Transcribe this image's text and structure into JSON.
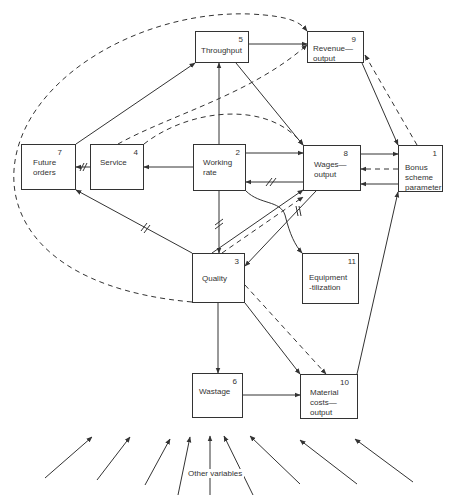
{
  "diagram": {
    "nodes": [
      {
        "id": "1",
        "label": "Bonus\nscheme\nparameter",
        "x": 398,
        "y": 145,
        "w": 45,
        "h": 47,
        "ly": 17
      },
      {
        "id": "2",
        "label": "Working\nrate",
        "x": 193,
        "y": 144,
        "w": 53,
        "h": 47,
        "ly": 13
      },
      {
        "id": "3",
        "label": "Quality",
        "x": 192,
        "y": 253,
        "w": 53,
        "h": 50,
        "ly": 20
      },
      {
        "id": "4",
        "label": "Service",
        "x": 90,
        "y": 144,
        "w": 54,
        "h": 46,
        "ly": 13
      },
      {
        "id": "5",
        "label": "Throughput",
        "x": 195,
        "y": 31,
        "w": 54,
        "h": 32,
        "ly": 14
      },
      {
        "id": "6",
        "label": "Wastage",
        "x": 192,
        "y": 373,
        "w": 51,
        "h": 45,
        "ly": 13
      },
      {
        "id": "7",
        "label": "Future\norders",
        "x": 21,
        "y": 144,
        "w": 55,
        "h": 46,
        "ly": 13
      },
      {
        "id": "8",
        "label": "Wages—\noutput",
        "x": 303,
        "y": 145,
        "w": 58,
        "h": 46,
        "ly": 14
      },
      {
        "id": "9",
        "label": "Revenue—\noutput",
        "x": 307,
        "y": 31,
        "w": 57,
        "h": 32,
        "ly": 12
      },
      {
        "id": "10",
        "label": "Material\ncosts—\noutput",
        "x": 300,
        "y": 374,
        "w": 58,
        "h": 45,
        "ly": 13
      },
      {
        "id": "11",
        "label": "Equipment\n-tilization",
        "x": 302,
        "y": 253,
        "w": 57,
        "h": 51,
        "ly": 19
      }
    ],
    "other_variables_label": "Other variables",
    "colors": {
      "line": "#333333",
      "background": "#ffffff"
    }
  }
}
